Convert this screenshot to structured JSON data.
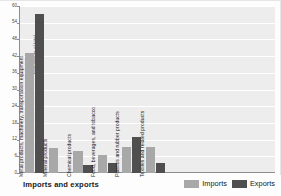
{
  "footer": {
    "title": "Imports and exports"
  },
  "legend": {
    "position": "bottom-right",
    "items": [
      {
        "label": "Imports",
        "color": "#a8a8a8"
      },
      {
        "label": "Exports",
        "color": "#4f4f4f"
      }
    ]
  },
  "chart_data": {
    "type": "bar",
    "title": "Imports and exports",
    "xlabel": "",
    "ylabel": "Percentage of total",
    "ylim": [
      0,
      60
    ],
    "ytick_interval": 6,
    "yticks": [
      60,
      54,
      48,
      42,
      36,
      30,
      24,
      18,
      12,
      6,
      0
    ],
    "grid": true,
    "grid_axis": "y",
    "legend_position": "bottom-right",
    "categories": [
      "Metal products, machinery, transportation equipment",
      "Mineral products",
      "Chemical products",
      "Food, beverages, and tobacco",
      "Plastics and rubber products",
      "Textiles and related products"
    ],
    "series": [
      {
        "name": "Imports",
        "color": "#a8a8a8",
        "values": [
          43,
          9,
          8,
          6.5,
          9.5,
          9.5
        ]
      },
      {
        "name": "Exports",
        "color": "#4f4f4f",
        "values": [
          57,
          null,
          3,
          3.5,
          13,
          3.5
        ]
      }
    ]
  }
}
